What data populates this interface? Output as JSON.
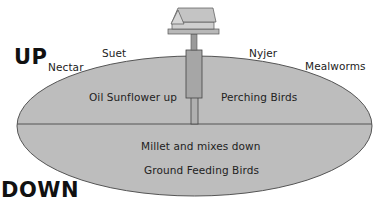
{
  "diagram": {
    "title_up": "UP",
    "title_down": "DOWN",
    "above_labels": {
      "nectar": "Nectar",
      "suet": "Suet",
      "nyjer": "Nyjer",
      "mealworms": "Mealworms"
    },
    "upper_half": {
      "left_label": "Oil Sunflower up",
      "right_label": "Perching Birds"
    },
    "lower_half": {
      "line1": "Millet and mixes down",
      "line2": "Ground Feeding Birds"
    },
    "colors": {
      "ellipse_fill": "#bdbdbd",
      "ellipse_stroke": "#555555",
      "pole_fill": "#a8a8a8",
      "feeder_fill": "#c4c4c4",
      "text": "#222222"
    }
  }
}
